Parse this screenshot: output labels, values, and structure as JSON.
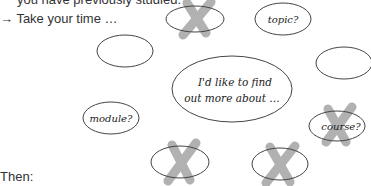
{
  "instructions": {
    "line1": "you have previously studied.",
    "line2": "→ Take your time …",
    "then": "Then:"
  },
  "mindmap": {
    "center": {
      "line1": "I'd like to find",
      "line2": "out more about …"
    },
    "bubbles": [
      {
        "id": "top-left-empty",
        "label": "",
        "crossed": false
      },
      {
        "id": "top-crossed",
        "label": "",
        "crossed": true
      },
      {
        "id": "topic",
        "label": "topic?",
        "crossed": false
      },
      {
        "id": "right-empty",
        "label": "",
        "crossed": false
      },
      {
        "id": "module",
        "label": "module?",
        "crossed": false
      },
      {
        "id": "course",
        "label": "course?",
        "crossed": true
      },
      {
        "id": "bottom-left-crossed",
        "label": "",
        "crossed": true
      },
      {
        "id": "bottom-right-crossed",
        "label": "",
        "crossed": true
      }
    ],
    "colors": {
      "outline": "#444444",
      "cross": "#a9a9a9"
    }
  }
}
